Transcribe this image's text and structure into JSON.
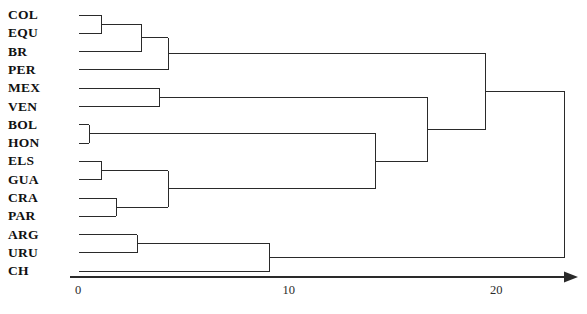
{
  "chart_data": {
    "type": "dendrogram",
    "title": "",
    "xlabel": "",
    "ylabel": "",
    "orientation": "horizontal",
    "grid": false,
    "legend": false,
    "axis": {
      "ticks": [
        {
          "label": "0",
          "value": 0
        },
        {
          "label": "10",
          "value": 10
        },
        {
          "label": "20",
          "value": 20
        }
      ],
      "range": [
        0,
        24.5
      ],
      "arrow": true
    },
    "leaves": [
      {
        "label": "COL"
      },
      {
        "label": "EQU"
      },
      {
        "label": "BR"
      },
      {
        "label": "PER"
      },
      {
        "label": "MEX"
      },
      {
        "label": "VEN"
      },
      {
        "label": "BOL"
      },
      {
        "label": "HON"
      },
      {
        "label": "ELS"
      },
      {
        "label": "GUA"
      },
      {
        "label": "CRA"
      },
      {
        "label": "PAR"
      },
      {
        "label": "ARG"
      },
      {
        "label": "URU"
      },
      {
        "label": "CH"
      }
    ],
    "merges": [
      {
        "id": "m1",
        "children": [
          "COL",
          "EQU"
        ],
        "distance": 1.1
      },
      {
        "id": "m2",
        "children": [
          "BOL",
          "HON"
        ],
        "distance": 0.5
      },
      {
        "id": "m3",
        "children": [
          "ELS",
          "GUA"
        ],
        "distance": 1.1
      },
      {
        "id": "m4",
        "children": [
          "CRA",
          "PAR"
        ],
        "distance": 1.8
      },
      {
        "id": "m5",
        "children": [
          "ARG",
          "URU"
        ],
        "distance": 2.8
      },
      {
        "id": "m6",
        "children": [
          "m1",
          "BR"
        ],
        "distance": 3.0
      },
      {
        "id": "m7",
        "children": [
          "MEX",
          "VEN"
        ],
        "distance": 3.9
      },
      {
        "id": "m8",
        "children": [
          "m6",
          "PER"
        ],
        "distance": 4.3
      },
      {
        "id": "m9",
        "children": [
          "m3",
          "m4"
        ],
        "distance": 4.3
      },
      {
        "id": "m10",
        "children": [
          "m5",
          "CH"
        ],
        "distance": 9.2
      },
      {
        "id": "m11",
        "children": [
          "m2",
          "m9"
        ],
        "distance": 14.3
      },
      {
        "id": "m12",
        "children": [
          "m11",
          "m7"
        ],
        "distance": 16.8
      },
      {
        "id": "m13",
        "children": [
          "m12",
          "m8"
        ],
        "distance": 19.6
      },
      {
        "id": "m14",
        "children": [
          "m13",
          "m10"
        ],
        "distance": 23.4
      }
    ],
    "colors": {
      "line": "#2a2a2a",
      "axis": "#2a2a2a",
      "text": "#111111",
      "background": "#ffffff"
    }
  },
  "layout": {
    "plot_left": 79,
    "plot_right": 575,
    "units_per_px": 20.75,
    "first_row_y": 15,
    "row_spacing": 18.3,
    "label_x": 8,
    "axis_y": 277,
    "tick_label_y": 284
  }
}
